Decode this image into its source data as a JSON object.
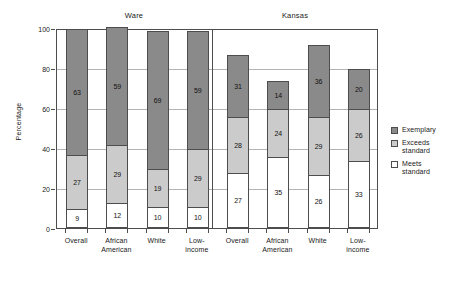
{
  "chart_data": {
    "type": "bar",
    "subtype": "stacked-bar-small-multiples",
    "title": "",
    "xlabel": "",
    "ylabel": "Percentage",
    "ylim": [
      0,
      100
    ],
    "yticks": [
      0,
      20,
      40,
      60,
      80,
      100
    ],
    "grid": true,
    "legend_position": "right",
    "panels": [
      {
        "name": "Ware",
        "categories": [
          "Overall",
          "African American",
          "White",
          "Low-income"
        ],
        "series": [
          {
            "name": "Meets standard",
            "values": [
              9,
              12,
              10,
              10
            ]
          },
          {
            "name": "Exceeds standard",
            "values": [
              27,
              29,
              19,
              29
            ]
          },
          {
            "name": "Exemplary",
            "values": [
              63,
              59,
              69,
              59
            ]
          }
        ],
        "totals": [
          99,
          100,
          98,
          98
        ]
      },
      {
        "name": "Kansas",
        "categories": [
          "Overall",
          "African American",
          "White",
          "Low-income"
        ],
        "series": [
          {
            "name": "Meets standard",
            "values": [
              27,
              35,
              26,
              33
            ]
          },
          {
            "name": "Exceeds standard",
            "values": [
              28,
              24,
              29,
              26
            ]
          },
          {
            "name": "Exemplary",
            "values": [
              31,
              14,
              36,
              20
            ]
          }
        ],
        "totals": [
          86,
          73,
          91,
          79
        ]
      }
    ],
    "legend": [
      {
        "label": "Exemplary",
        "color": "#8a8a8a"
      },
      {
        "label": "Exceeds standard",
        "color": "#cbcbcb"
      },
      {
        "label": "Meets standard",
        "color": "#ffffff"
      }
    ],
    "colors": {
      "exemplary": "#8a8a8a",
      "exceeds": "#cbcbcb",
      "meets": "#ffffff",
      "axis": "#4d4d4d",
      "grid": "#b3b3b3",
      "background": "#ffffff"
    }
  },
  "legend_lines": {
    "exemplary": [
      "Exemplary"
    ],
    "exceeds": [
      "Exceeds",
      "standard"
    ],
    "meets": [
      "Meets",
      "standard"
    ]
  },
  "category_lines": {
    "overall": [
      "Overall",
      ""
    ],
    "african_american": [
      "African",
      "American"
    ],
    "white": [
      "White",
      ""
    ],
    "low_income": [
      "Low-",
      "income"
    ]
  }
}
